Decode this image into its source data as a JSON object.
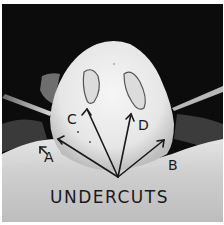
{
  "figure": {
    "caption": "UNDERCUTS",
    "labels": {
      "a": "A",
      "b": "B",
      "c": "C",
      "d": "D"
    },
    "colors": {
      "background": "#0c0c0c",
      "cast": "#ececec",
      "base": "#c9c9c9",
      "ink": "#1a1a1a"
    }
  }
}
